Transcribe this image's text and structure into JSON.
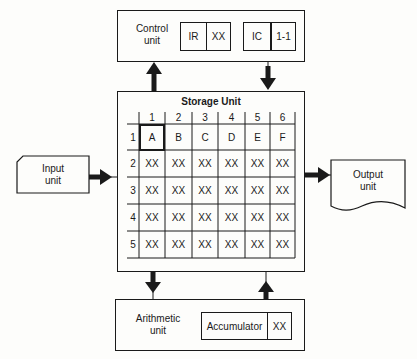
{
  "control_unit": {
    "label_line1": "Control",
    "label_line2": "unit",
    "registers": [
      {
        "name": "IR",
        "value": "XX"
      },
      {
        "name": "IC",
        "value": "1-1"
      }
    ]
  },
  "storage_unit": {
    "title": "Storage Unit",
    "column_headers": [
      "1",
      "2",
      "3",
      "4",
      "5",
      "6"
    ],
    "row_headers": [
      "1",
      "2",
      "3",
      "4",
      "5"
    ],
    "rows": [
      [
        "A",
        "B",
        "C",
        "D",
        "E",
        "F"
      ],
      [
        "XX",
        "XX",
        "XX",
        "XX",
        "XX",
        "XX"
      ],
      [
        "XX",
        "XX",
        "XX",
        "XX",
        "XX",
        "XX"
      ],
      [
        "XX",
        "XX",
        "XX",
        "XX",
        "XX",
        "XX"
      ],
      [
        "XX",
        "XX",
        "XX",
        "XX",
        "XX",
        "XX"
      ]
    ],
    "highlighted_cell": "1-1"
  },
  "input_unit": {
    "label_line1": "Input",
    "label_line2": "unit"
  },
  "output_unit": {
    "label_line1": "Output",
    "label_line2": "unit"
  },
  "arithmetic_unit": {
    "label_line1": "Arithmetic",
    "label_line2": "unit",
    "register": {
      "name": "Accumulator",
      "value": "XX"
    }
  },
  "arrows": [
    {
      "from": "storage_unit",
      "to": "control_unit",
      "direction": "up"
    },
    {
      "from": "control_unit",
      "to": "storage_unit",
      "direction": "down"
    },
    {
      "from": "input_unit",
      "to": "storage_unit",
      "direction": "right"
    },
    {
      "from": "storage_unit",
      "to": "output_unit",
      "direction": "right"
    },
    {
      "from": "storage_unit",
      "to": "arithmetic_unit",
      "direction": "down"
    },
    {
      "from": "arithmetic_unit",
      "to": "storage_unit",
      "direction": "up"
    }
  ]
}
